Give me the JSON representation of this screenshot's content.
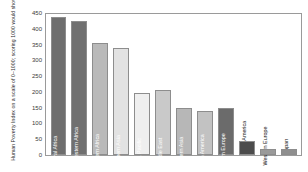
{
  "chart_data": {
    "type": "bar",
    "title": "",
    "xlabel": "",
    "ylabel": "Human Poverty Index on a scale of 0–1000; scoring 1000 would show 100% poverty",
    "ylim": [
      0,
      450
    ],
    "ytick_labels": [
      "450",
      "400",
      "350",
      "300",
      "250",
      "200",
      "150",
      "100",
      "50",
      "0"
    ],
    "ytick_values": [
      450,
      400,
      350,
      300,
      250,
      200,
      150,
      100,
      50,
      0
    ],
    "grid": false,
    "legend": "none",
    "categories": [
      "Central Africa",
      "South-western Africa",
      "Northern Africa",
      "Southern Asia",
      "Asia Pacific",
      "Middle East",
      "Eastern Asia",
      "South America",
      "Eastern Europe",
      "North America",
      "Western Europe",
      "Japan"
    ],
    "values": [
      437,
      425,
      355,
      338,
      195,
      205,
      150,
      140,
      150,
      45,
      18,
      18
    ],
    "bar_colors": [
      "#6e6e6e",
      "#707070",
      "#b9b9b9",
      "#e2e2e2",
      "#efefef",
      "#c9c9c9",
      "#b7b7b7",
      "#c2c2c2",
      "#6b6b6b",
      "#4c4c4c",
      "#9a9a9a",
      "#8f8f8f"
    ],
    "label_placement": [
      "inside",
      "inside",
      "inside",
      "inside",
      "inside",
      "inside",
      "inside",
      "inside",
      "inside",
      "outside",
      "outside",
      "outside"
    ],
    "axis_color": "#9a9a9a",
    "text_color": "#2b2b2b"
  }
}
